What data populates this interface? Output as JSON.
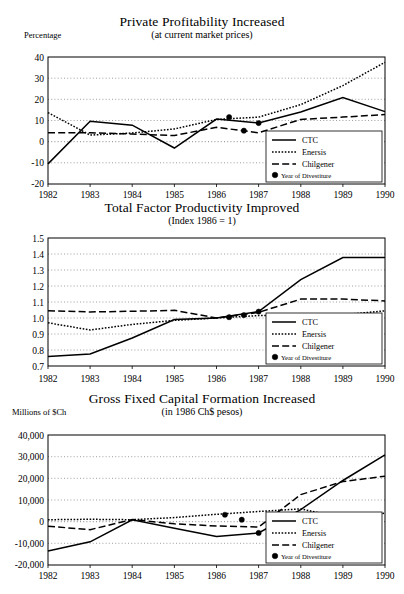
{
  "figure": {
    "series_names": [
      "CTC",
      "Enersis",
      "Chilgener"
    ],
    "legend": {
      "ctc_label": "CTC",
      "enersis_label": "Enersis",
      "chilgener_label": "Chilgener",
      "divestiture_label": "Year of Divestiture"
    },
    "years": [
      "1982",
      "1983",
      "1984",
      "1985",
      "1986",
      "1987",
      "1988",
      "1989",
      "1990"
    ]
  },
  "chart_data": [
    {
      "type": "line",
      "id": "private-profitability",
      "title": "Private Profitability Increased",
      "subtitle": "(at current market prices)",
      "ylabel": "Percentage",
      "xlabel": "",
      "ylim": [
        -20,
        40
      ],
      "ytick_labels": [
        "40",
        "30",
        "20",
        "10",
        "0",
        "-10",
        "-20"
      ],
      "yticks": [
        40,
        30,
        20,
        10,
        0,
        -10,
        -20
      ],
      "grid": true,
      "legend_position": "bottom-right",
      "x": [
        1982,
        1983,
        1984,
        1985,
        1986,
        1987,
        1988,
        1989,
        1990
      ],
      "xtick_labels": [
        "1982",
        "1983",
        "1984",
        "1985",
        "1986",
        "1987",
        "1988",
        "1989",
        "1990"
      ],
      "series": [
        {
          "name": "CTC",
          "values": [
            -10.5,
            9.6,
            7.8,
            -3.0,
            10.7,
            8.8,
            14.0,
            20.8,
            14.2
          ]
        },
        {
          "name": "Enersis",
          "values": [
            13.7,
            3.1,
            4.1,
            6.0,
            10.5,
            11.6,
            17.5,
            26.5,
            37.5
          ]
        },
        {
          "name": "Chilgener",
          "values": [
            4.2,
            4.2,
            3.6,
            2.9,
            6.8,
            4.2,
            10.5,
            11.6,
            12.8
          ]
        }
      ],
      "divestiture_markers": [
        {
          "series": "Enersis",
          "x": 1986.3,
          "y": 11.6
        },
        {
          "series": "Chilgener",
          "x": 1986.65,
          "y": 5.2
        },
        {
          "series": "CTC",
          "x": 1987.0,
          "y": 8.8
        }
      ]
    },
    {
      "type": "line",
      "id": "total-factor-productivity",
      "title": "Total Factor Productivity Improved",
      "subtitle": "(Index 1986 = 1)",
      "ylabel": "",
      "xlabel": "",
      "ylim": [
        0.7,
        1.5
      ],
      "ytick_labels": [
        "1.5",
        "1.4",
        "1.3",
        "1.2",
        "1.1",
        "1.0",
        "0.9",
        "0.8",
        "0.7"
      ],
      "yticks": [
        1.5,
        1.4,
        1.3,
        1.2,
        1.1,
        1.0,
        0.9,
        0.8,
        0.7
      ],
      "grid": true,
      "legend_position": "bottom-right",
      "x": [
        1982,
        1983,
        1984,
        1985,
        1986,
        1987,
        1988,
        1989,
        1990
      ],
      "xtick_labels": [
        "1982",
        "1983",
        "1984",
        "1985",
        "1986",
        "1987",
        "1988",
        "1989",
        "1990"
      ],
      "series": [
        {
          "name": "CTC",
          "values": [
            0.76,
            0.775,
            0.875,
            0.99,
            1.0,
            1.04,
            1.24,
            1.378,
            1.378
          ]
        },
        {
          "name": "Enersis",
          "values": [
            0.97,
            0.925,
            0.96,
            0.985,
            1.0,
            1.015,
            1.02,
            1.02,
            1.045
          ]
        },
        {
          "name": "Chilgener",
          "values": [
            1.045,
            1.038,
            1.042,
            1.048,
            1.0,
            1.035,
            1.118,
            1.118,
            1.107
          ]
        }
      ],
      "divestiture_markers": [
        {
          "series": "Enersis",
          "x": 1986.3,
          "y": 1.005
        },
        {
          "series": "Chilgener",
          "x": 1986.65,
          "y": 1.018
        },
        {
          "series": "CTC",
          "x": 1987.0,
          "y": 1.04
        }
      ]
    },
    {
      "type": "line",
      "id": "gross-fixed-capital-formation",
      "title": "Gross Fixed Capital Formation Increased",
      "subtitle": "(in 1986 Ch$ pesos)",
      "ylabel": "Millions of $Ch",
      "xlabel": "",
      "ylim": [
        -20000,
        40000
      ],
      "ytick_labels": [
        "40,000",
        "30,000",
        "20,000",
        "10,000",
        "0",
        "-10,000",
        "-20,000"
      ],
      "yticks": [
        40000,
        30000,
        20000,
        10000,
        0,
        -10000,
        -20000
      ],
      "grid": true,
      "legend_position": "bottom-right",
      "x": [
        1982,
        1983,
        1984,
        1985,
        1986,
        1987,
        1988,
        1989,
        1990
      ],
      "xtick_labels": [
        "1982",
        "1983",
        "1984",
        "1985",
        "1986",
        "1987",
        "1988",
        "1989",
        "1990"
      ],
      "series": [
        {
          "name": "CTC",
          "values": [
            -13500,
            -9300,
            900,
            -3000,
            -6800,
            -5200,
            5600,
            19000,
            30800
          ]
        },
        {
          "name": "Enersis",
          "values": [
            900,
            1100,
            900,
            1900,
            3400,
            4700,
            5900,
            1700,
            3900
          ]
        },
        {
          "name": "Chilgener",
          "values": [
            -2100,
            -3700,
            1000,
            -1000,
            -2000,
            -2500,
            12500,
            18500,
            21000
          ]
        }
      ],
      "divestiture_markers": [
        {
          "series": "Enersis",
          "x": 1986.2,
          "y": 3200
        },
        {
          "series": "Chilgener",
          "x": 1986.6,
          "y": 900
        },
        {
          "series": "CTC",
          "x": 1987.0,
          "y": -5200
        }
      ]
    }
  ]
}
